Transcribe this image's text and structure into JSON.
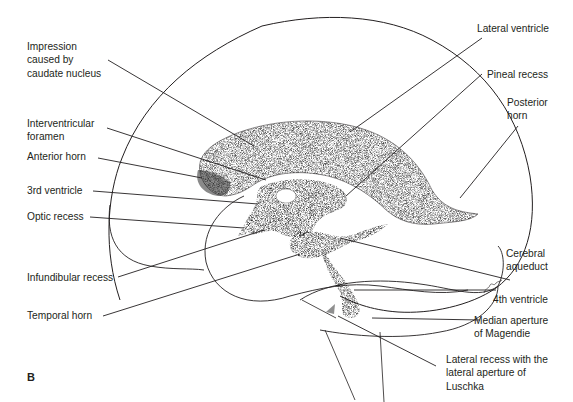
{
  "figure": {
    "panel_letter": "B",
    "colors": {
      "ink": "#231f20",
      "background": "#ffffff",
      "stipple": "#3a3a3a"
    }
  },
  "labels_left": [
    {
      "id": "impression-caudate",
      "text": "Impression\ncaused by\ncaudate nucleus"
    },
    {
      "id": "interventricular-foramen",
      "text": "Interventricular\nforamen"
    },
    {
      "id": "anterior-horn",
      "text": "Anterior horn"
    },
    {
      "id": "third-ventricle",
      "text": "3rd ventricle"
    },
    {
      "id": "optic-recess",
      "text": "Optic recess"
    },
    {
      "id": "infundibular-recess",
      "text": "Infundibular recess"
    },
    {
      "id": "temporal-horn",
      "text": "Temporal horn"
    }
  ],
  "labels_right": [
    {
      "id": "lateral-ventricle",
      "text": "Lateral ventricle"
    },
    {
      "id": "pineal-recess",
      "text": "Pineal recess"
    },
    {
      "id": "posterior-horn",
      "text": "Posterior\nhorn"
    },
    {
      "id": "cerebral-aqueduct",
      "text": "Cerebral\naqueduct"
    },
    {
      "id": "fourth-ventricle",
      "text": "4th ventricle"
    },
    {
      "id": "median-aperture",
      "text": "Median aperture\nof Magendie"
    },
    {
      "id": "lateral-recess",
      "text": "Lateral recess with the\nlateral aperture of\nLuschka"
    }
  ]
}
